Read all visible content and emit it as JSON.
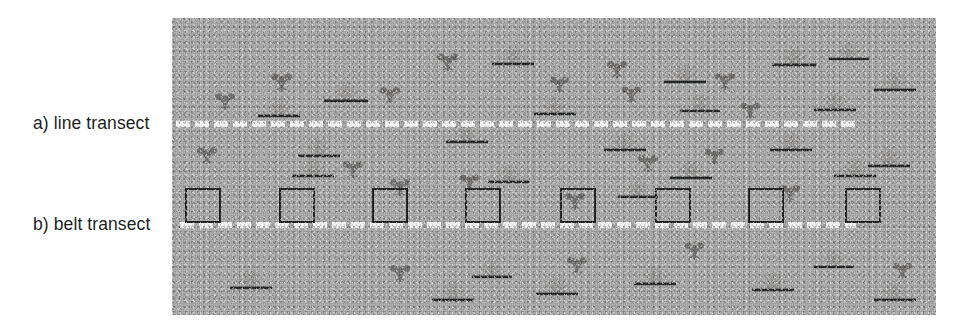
{
  "figure": {
    "labels": {
      "line_transect": "a) line transect",
      "belt_transect": "b) belt transect"
    },
    "colors": {
      "background": "#ffffff",
      "habitat_ground": "#ababab",
      "transect_dash": "#fdfdfd",
      "quadrat_border": "#17191a",
      "clover_plant": "#6e6d6b",
      "grass_plant": "#9a9997",
      "ground_line": "#1d1f20",
      "label_text": "#211f1e"
    },
    "habitat": {
      "x": 172,
      "y": 18,
      "width": 764,
      "height": 297
    },
    "transects": [
      {
        "name": "line-transect",
        "label": "a) line transect",
        "x": 4,
        "y": 103,
        "width": 682,
        "style": "dashed-white"
      },
      {
        "name": "belt-transect",
        "label": "b) belt transect",
        "x": 8,
        "y": 204,
        "width": 676,
        "style": "dashed-white"
      }
    ],
    "quadrats": [
      {
        "x": 13,
        "y": 170
      },
      {
        "x": 107,
        "y": 170
      },
      {
        "x": 200,
        "y": 170
      },
      {
        "x": 293,
        "y": 170
      },
      {
        "x": 388,
        "y": 170
      },
      {
        "x": 483,
        "y": 170
      },
      {
        "x": 576,
        "y": 170
      },
      {
        "x": 673,
        "y": 170
      }
    ],
    "plants": [
      {
        "type": "clover",
        "x": 40,
        "y": 68,
        "s": 1.0
      },
      {
        "type": "clover",
        "x": 96,
        "y": 48,
        "s": 1.05
      },
      {
        "type": "clover",
        "x": 205,
        "y": 62,
        "s": 1.0
      },
      {
        "type": "clover",
        "x": 262,
        "y": 28,
        "s": 1.05
      },
      {
        "type": "clover",
        "x": 375,
        "y": 52,
        "s": 0.95
      },
      {
        "type": "clover",
        "x": 432,
        "y": 36,
        "s": 1.0
      },
      {
        "type": "clover",
        "x": 447,
        "y": 62,
        "s": 0.95
      },
      {
        "type": "clover",
        "x": 540,
        "y": 48,
        "s": 1.0
      },
      {
        "type": "clover",
        "x": 566,
        "y": 78,
        "s": 0.95
      },
      {
        "type": "clover",
        "x": 22,
        "y": 122,
        "s": 1.0
      },
      {
        "type": "clover",
        "x": 168,
        "y": 136,
        "s": 1.0
      },
      {
        "type": "clover",
        "x": 215,
        "y": 154,
        "s": 1.0
      },
      {
        "type": "clover",
        "x": 285,
        "y": 150,
        "s": 0.95
      },
      {
        "type": "clover",
        "x": 390,
        "y": 168,
        "s": 1.0
      },
      {
        "type": "clover",
        "x": 463,
        "y": 130,
        "s": 1.0
      },
      {
        "type": "clover",
        "x": 530,
        "y": 124,
        "s": 0.95
      },
      {
        "type": "clover",
        "x": 605,
        "y": 160,
        "s": 1.0
      },
      {
        "type": "clover",
        "x": 215,
        "y": 240,
        "s": 1.0
      },
      {
        "type": "clover",
        "x": 392,
        "y": 232,
        "s": 1.0
      },
      {
        "type": "clover",
        "x": 510,
        "y": 218,
        "s": 0.95
      },
      {
        "type": "clover",
        "x": 718,
        "y": 238,
        "s": 0.95
      },
      {
        "type": "grass",
        "x": 84,
        "y": 78,
        "s": 1.0
      },
      {
        "type": "grass",
        "x": 150,
        "y": 62,
        "s": 1.05
      },
      {
        "type": "grass",
        "x": 318,
        "y": 26,
        "s": 1.0
      },
      {
        "type": "grass",
        "x": 360,
        "y": 76,
        "s": 1.0
      },
      {
        "type": "grass",
        "x": 490,
        "y": 44,
        "s": 1.0
      },
      {
        "type": "grass",
        "x": 506,
        "y": 74,
        "s": 0.95
      },
      {
        "type": "grass",
        "x": 598,
        "y": 26,
        "s": 1.05
      },
      {
        "type": "grass",
        "x": 640,
        "y": 72,
        "s": 1.0
      },
      {
        "type": "grass",
        "x": 655,
        "y": 22,
        "s": 0.95
      },
      {
        "type": "grass",
        "x": 700,
        "y": 52,
        "s": 1.0
      },
      {
        "type": "grass",
        "x": 124,
        "y": 118,
        "s": 1.0
      },
      {
        "type": "grass",
        "x": 118,
        "y": 138,
        "s": 1.0
      },
      {
        "type": "grass",
        "x": 272,
        "y": 104,
        "s": 1.0
      },
      {
        "type": "grass",
        "x": 314,
        "y": 144,
        "s": 1.0
      },
      {
        "type": "grass",
        "x": 430,
        "y": 112,
        "s": 1.0
      },
      {
        "type": "grass",
        "x": 444,
        "y": 160,
        "s": 0.95
      },
      {
        "type": "grass",
        "x": 496,
        "y": 140,
        "s": 1.0
      },
      {
        "type": "grass",
        "x": 596,
        "y": 112,
        "s": 1.0
      },
      {
        "type": "grass",
        "x": 660,
        "y": 138,
        "s": 1.0
      },
      {
        "type": "grass",
        "x": 694,
        "y": 128,
        "s": 1.0
      },
      {
        "type": "grass",
        "x": 56,
        "y": 250,
        "s": 1.0
      },
      {
        "type": "grass",
        "x": 258,
        "y": 262,
        "s": 1.0
      },
      {
        "type": "grass",
        "x": 298,
        "y": 240,
        "s": 0.95
      },
      {
        "type": "grass",
        "x": 362,
        "y": 256,
        "s": 1.0
      },
      {
        "type": "grass",
        "x": 460,
        "y": 246,
        "s": 1.0
      },
      {
        "type": "grass",
        "x": 578,
        "y": 252,
        "s": 1.0
      },
      {
        "type": "grass",
        "x": 640,
        "y": 230,
        "s": 0.95
      },
      {
        "type": "grass",
        "x": 700,
        "y": 262,
        "s": 1.0
      }
    ]
  }
}
